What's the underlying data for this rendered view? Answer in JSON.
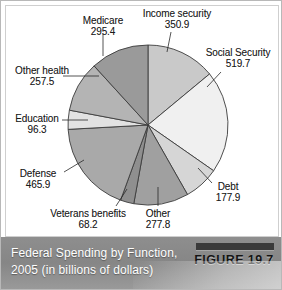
{
  "figure": {
    "caption": "Federal Spending by Function, 2005 (in billions of dollars)",
    "badge_label": "FIGURE 19.7"
  },
  "chart_data": {
    "type": "pie",
    "title": "Federal Spending by Function, 2005 (in billions of dollars)",
    "units": "billions of dollars",
    "year": "2005",
    "total": 2509.6,
    "start_angle_deg": 0,
    "direction": "clockwise",
    "legend": "none-labels-outside",
    "grid": false,
    "categories": [
      "Income security",
      "Social Security",
      "Debt",
      "Other",
      "Veterans benefits",
      "Defense",
      "Education",
      "Other health",
      "Medicare"
    ],
    "values": [
      350.9,
      519.7,
      177.9,
      277.8,
      68.2,
      465.9,
      96.3,
      257.5,
      295.4
    ],
    "colors": [
      "#c9c9c9",
      "#f0f0f0",
      "#d6d6d6",
      "#a0a0a0",
      "#8f8f8f",
      "#a9a9a9",
      "#e2e2e2",
      "#b4b4b4",
      "#9a9a9a"
    ],
    "slices": [
      {
        "label": "Income security",
        "value": "350.9",
        "value_num": 350.9,
        "color": "#c9c9c9"
      },
      {
        "label": "Social Security",
        "value": "519.7",
        "value_num": 519.7,
        "color": "#f0f0f0"
      },
      {
        "label": "Debt",
        "value": "177.9",
        "value_num": 177.9,
        "color": "#d6d6d6"
      },
      {
        "label": "Other",
        "value": "277.8",
        "value_num": 277.8,
        "color": "#a0a0a0"
      },
      {
        "label": "Veterans benefits",
        "value": "68.2",
        "value_num": 68.2,
        "color": "#8f8f8f"
      },
      {
        "label": "Defense",
        "value": "465.9",
        "value_num": 465.9,
        "color": "#a9a9a9"
      },
      {
        "label": "Education",
        "value": "96.3",
        "value_num": 96.3,
        "color": "#e2e2e2"
      },
      {
        "label": "Other health",
        "value": "257.5",
        "value_num": 257.5,
        "color": "#b4b4b4"
      },
      {
        "label": "Medicare",
        "value": "295.4",
        "value_num": 295.4,
        "color": "#9a9a9a"
      }
    ]
  }
}
